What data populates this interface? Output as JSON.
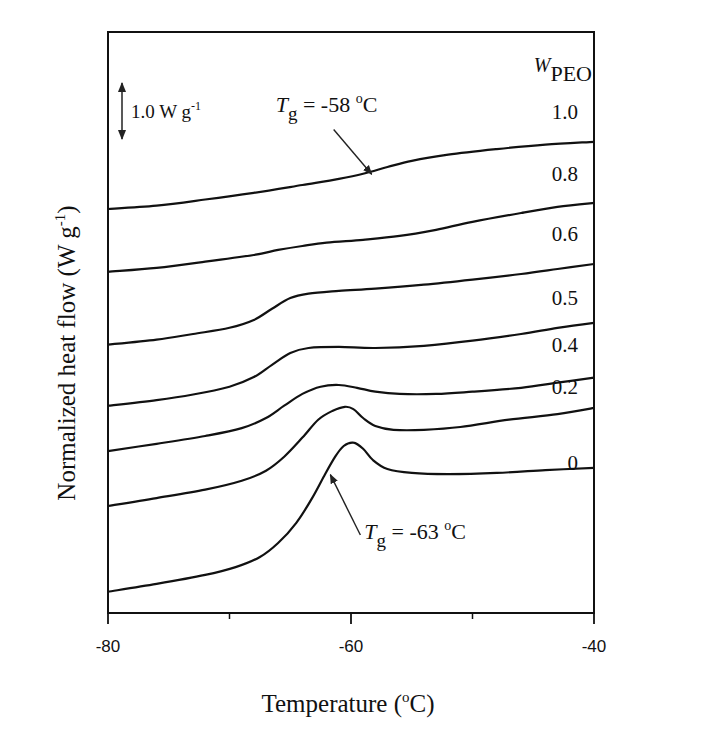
{
  "chart_data": {
    "type": "line",
    "title": "",
    "xlabel": "Temperature (°C)",
    "xlabel_parts": {
      "main": "Temperature (",
      "sup": "o",
      "end": "C)"
    },
    "ylabel": "Normalized heat flow (W g-1)",
    "ylabel_parts": {
      "main": "Normalized heat flow (W g",
      "sup": "-1",
      "end": ")"
    },
    "xlim": [
      -80,
      -40
    ],
    "ylim": [
      0,
      10.37
    ],
    "x_ticks": [
      {
        "value": -80,
        "label": "-80"
      },
      {
        "value": -60,
        "label": "-60"
      },
      {
        "value": -40,
        "label": "-40"
      }
    ],
    "x_minor_ticks": [
      -70,
      -50
    ],
    "y_ticks_shown": false,
    "grid": false,
    "legend": {
      "title_main": "W",
      "title_sub": "PEO",
      "placement": "right-end-of-curves"
    },
    "scale_bar": {
      "value": 1.0,
      "label_main": "1.0 W g",
      "label_sup": "-1",
      "placement": "top-left"
    },
    "annotations": [
      {
        "name": "tg-annotation-1.0",
        "text_main": "T",
        "text_sub": "g",
        "text_rest": " = -58 ",
        "text_sup": "o",
        "text_end": "C",
        "target": {
          "x": -58.3,
          "y": 7.83
        },
        "text_at": {
          "x": -66.2,
          "y": 8.95
        }
      },
      {
        "name": "tg-annotation-0",
        "text_main": "T",
        "text_sub": "g",
        "text_rest": " = -63 ",
        "text_sup": "o",
        "text_end": "C",
        "target": {
          "x": -61.7,
          "y": 2.47
        },
        "text_at": {
          "x": -58.9,
          "y": 1.32
        }
      }
    ],
    "series": [
      {
        "name": "1.0",
        "label": "1.0",
        "label_y": 8.95,
        "points": [
          [
            -80,
            7.21
          ],
          [
            -76,
            7.27
          ],
          [
            -72,
            7.38
          ],
          [
            -68,
            7.5
          ],
          [
            -64,
            7.64
          ],
          [
            -61,
            7.75
          ],
          [
            -59,
            7.84
          ],
          [
            -57,
            7.96
          ],
          [
            -55,
            8.07
          ],
          [
            -52,
            8.18
          ],
          [
            -48,
            8.28
          ],
          [
            -44,
            8.36
          ],
          [
            -40,
            8.41
          ]
        ]
      },
      {
        "name": "0.8",
        "label": "0.8",
        "label_y": 7.84,
        "points": [
          [
            -80,
            6.09
          ],
          [
            -76,
            6.16
          ],
          [
            -72,
            6.27
          ],
          [
            -68,
            6.39
          ],
          [
            -66,
            6.48
          ],
          [
            -64,
            6.55
          ],
          [
            -62,
            6.61
          ],
          [
            -59,
            6.66
          ],
          [
            -56,
            6.73
          ],
          [
            -53,
            6.84
          ],
          [
            -50,
            6.98
          ],
          [
            -46,
            7.14
          ],
          [
            -43,
            7.25
          ],
          [
            -40,
            7.32
          ]
        ]
      },
      {
        "name": "0.6",
        "label": "0.6",
        "label_y": 6.77,
        "points": [
          [
            -80,
            4.79
          ],
          [
            -76,
            4.88
          ],
          [
            -73,
            4.98
          ],
          [
            -70,
            5.09
          ],
          [
            -68,
            5.23
          ],
          [
            -66.5,
            5.43
          ],
          [
            -65,
            5.62
          ],
          [
            -63.5,
            5.7
          ],
          [
            -61,
            5.75
          ],
          [
            -58,
            5.79
          ],
          [
            -54,
            5.86
          ],
          [
            -50,
            5.95
          ],
          [
            -46,
            6.05
          ],
          [
            -43,
            6.14
          ],
          [
            -40,
            6.23
          ]
        ]
      },
      {
        "name": "0.5",
        "label": "0.5",
        "label_y": 5.63,
        "points": [
          [
            -80,
            3.7
          ],
          [
            -76,
            3.8
          ],
          [
            -73,
            3.9
          ],
          [
            -70,
            4.04
          ],
          [
            -68,
            4.21
          ],
          [
            -66.5,
            4.43
          ],
          [
            -65,
            4.64
          ],
          [
            -63.5,
            4.73
          ],
          [
            -61,
            4.75
          ],
          [
            -58,
            4.73
          ],
          [
            -54,
            4.77
          ],
          [
            -50,
            4.86
          ],
          [
            -46,
            4.98
          ],
          [
            -43,
            5.09
          ],
          [
            -40,
            5.18
          ]
        ]
      },
      {
        "name": "0.4",
        "label": "0.4",
        "label_y": 4.79,
        "points": [
          [
            -80,
            2.89
          ],
          [
            -76,
            3.02
          ],
          [
            -72,
            3.16
          ],
          [
            -69,
            3.3
          ],
          [
            -67,
            3.48
          ],
          [
            -65.5,
            3.7
          ],
          [
            -64,
            3.91
          ],
          [
            -62.5,
            4.04
          ],
          [
            -61,
            4.07
          ],
          [
            -59.5,
            4.02
          ],
          [
            -58,
            3.95
          ],
          [
            -56,
            3.91
          ],
          [
            -53,
            3.91
          ],
          [
            -50,
            3.95
          ],
          [
            -46,
            4.02
          ],
          [
            -43,
            4.11
          ],
          [
            -40,
            4.2
          ]
        ]
      },
      {
        "name": "0.2",
        "label": "0.2",
        "label_y": 4.04,
        "points": [
          [
            -80,
            1.91
          ],
          [
            -76,
            2.05
          ],
          [
            -72,
            2.2
          ],
          [
            -69,
            2.36
          ],
          [
            -67,
            2.54
          ],
          [
            -65.5,
            2.79
          ],
          [
            -64,
            3.13
          ],
          [
            -62.7,
            3.45
          ],
          [
            -61.5,
            3.61
          ],
          [
            -60.5,
            3.68
          ],
          [
            -59.8,
            3.64
          ],
          [
            -59,
            3.48
          ],
          [
            -58,
            3.34
          ],
          [
            -56.5,
            3.27
          ],
          [
            -54,
            3.27
          ],
          [
            -51,
            3.32
          ],
          [
            -47,
            3.45
          ],
          [
            -43,
            3.55
          ],
          [
            -40,
            3.66
          ]
        ]
      },
      {
        "name": "0",
        "label": "0",
        "label_y": 2.68,
        "points": [
          [
            -80,
            0.38
          ],
          [
            -76,
            0.52
          ],
          [
            -72,
            0.68
          ],
          [
            -69.5,
            0.82
          ],
          [
            -67.5,
            1.0
          ],
          [
            -66,
            1.25
          ],
          [
            -64.5,
            1.61
          ],
          [
            -63.2,
            2.05
          ],
          [
            -62.2,
            2.45
          ],
          [
            -61.3,
            2.79
          ],
          [
            -60.6,
            2.98
          ],
          [
            -59.8,
            3.04
          ],
          [
            -59,
            2.93
          ],
          [
            -58.2,
            2.73
          ],
          [
            -57,
            2.57
          ],
          [
            -55,
            2.5
          ],
          [
            -52,
            2.48
          ],
          [
            -48,
            2.5
          ],
          [
            -44,
            2.55
          ],
          [
            -40,
            2.59
          ]
        ]
      }
    ]
  }
}
